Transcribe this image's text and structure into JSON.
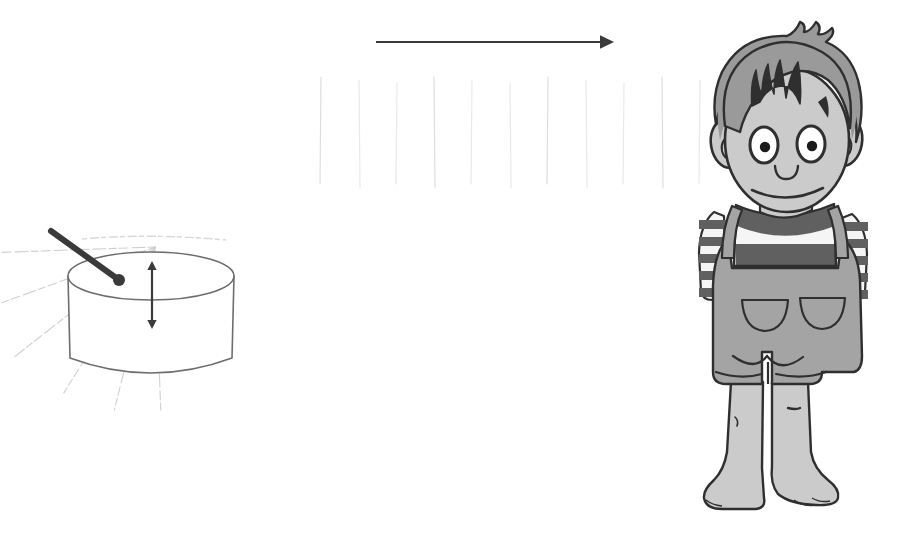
{
  "illustration": {
    "title": "Sound propagation from a drum to a listening boy",
    "background_color": "#ffffff",
    "canvas": {
      "width": 904,
      "height": 536
    }
  },
  "palette": {
    "ink": "#3a3a3a",
    "ink_soft": "#555555",
    "outline": "#2f2f2f",
    "wave_faint": "#d9d9d9",
    "wave_ray": "#cfcfcf",
    "skin": "#cbcbcb",
    "skin_shadow": "#b9b9b9",
    "hair": "#9a9a9a",
    "overalls": "#a4a4a4",
    "overalls_dark": "#8e8e8e",
    "shirt_dark": "#606060",
    "shirt_light": "#f5f5f5",
    "drum_fill": "#ffffff",
    "drum_outline": "#6d6d6d",
    "stick": "#3a3a3a",
    "arrow": "#3a3a3a"
  },
  "elements": {
    "direction_arrow": {
      "name": "direction-of-travel-arrow",
      "label": "",
      "x1": 376,
      "y1": 42,
      "x2": 614,
      "y2": 42,
      "head_size": 11,
      "color": "#3a3a3a",
      "stroke_width": 2
    },
    "amplitude_arrow": {
      "name": "drum-amplitude-double-arrow",
      "label": "",
      "x": 152,
      "y_top": 261,
      "y_bottom": 329,
      "color": "#3a3a3a",
      "stroke_width": 2.2,
      "head_size": 7
    },
    "drum": {
      "name": "drum",
      "center_x": 151,
      "top_ellipse_cy": 276,
      "rx": 83,
      "ry": 24,
      "body_bottom_y": 374,
      "fill": "#ffffff",
      "outline": "#6d6d6d",
      "outline_width": 1.6
    },
    "drumstick": {
      "name": "drumstick",
      "x1": 51,
      "y1": 231,
      "x2": 119,
      "y2": 280,
      "tip_radius": 6,
      "color": "#3a3a3a",
      "stroke_width": 6
    },
    "sound_rays": {
      "name": "radiating-sound-rays",
      "origin_x": 155,
      "origin_y": 247,
      "count": 6,
      "color": "#cfcfcf",
      "stroke_width": 1.1,
      "angles_deg": [
        -182,
        -200,
        -218,
        -238,
        -256,
        -272
      ],
      "lengths": [
        185,
        180,
        178,
        172,
        168,
        165
      ]
    },
    "wavefronts": {
      "name": "vertical-wavefront-lines",
      "color": "#dcdcdc",
      "stroke_width": 1.2,
      "y_top": 80,
      "y_bottom": 186,
      "x_positions": [
        321,
        359,
        397,
        434,
        472,
        510,
        548,
        586,
        624,
        662,
        700
      ]
    },
    "boy": {
      "name": "listening-boy",
      "head_center_x": 787,
      "head_center_y": 140,
      "head_rx": 62,
      "head_ry": 72,
      "feet_y": 512,
      "hair_color": "#9a9a9a",
      "skin_color": "#cbcbcb",
      "overalls_color": "#a4a4a4",
      "shirt_stripe_dark": "#606060",
      "shirt_stripe_light": "#f5f5f5",
      "features": {
        "eyes": 2,
        "ears": 2,
        "pockets": 2,
        "expression": "smiling"
      }
    }
  }
}
